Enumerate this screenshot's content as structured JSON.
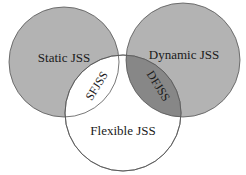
{
  "diagram": {
    "type": "venn",
    "sets": [
      {
        "id": "static",
        "label": "Static JSS",
        "fill": "#b3b3b3"
      },
      {
        "id": "dynamic",
        "label": "Dynamic JSS",
        "fill": "#b3b3b3"
      },
      {
        "id": "flexible",
        "label": "Flexible JSS",
        "fill": "#ffffff"
      }
    ],
    "intersections": [
      {
        "id": "static-flexible",
        "label": "SFJSS",
        "fill": "#ffffff"
      },
      {
        "id": "dynamic-flexible",
        "label": "DFJSS",
        "fill": "#878787"
      }
    ],
    "stroke": "#555555"
  }
}
